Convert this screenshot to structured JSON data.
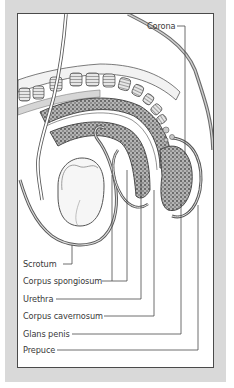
{
  "diagram": {
    "colors": {
      "frame": "#d9d9d9",
      "panel": "#ffffff",
      "line": "#4a4a4a",
      "tissue_fill": "#8a8a8a",
      "text": "#3a3a3a"
    },
    "labels": {
      "corona": "Corona",
      "scrotum": "Scrotum",
      "corpus_spongiosum": "Corpus spongiosum",
      "urethra": "Urethra",
      "corpus_cavernosum": "Corpus cavernosum",
      "glans_penis": "Glans penis",
      "prepuce": "Prepuce"
    }
  }
}
